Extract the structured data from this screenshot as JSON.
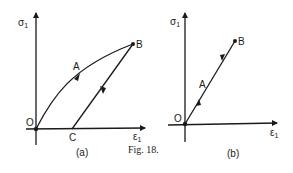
{
  "figure": {
    "caption": "Fig. 18.",
    "panels": [
      {
        "id": "a",
        "label": "(a)",
        "y_axis_label": "σ",
        "y_axis_sub": "1",
        "x_axis_label": "ε",
        "x_axis_sub": "1",
        "points": {
          "origin": "O",
          "mid": "A",
          "peak": "B",
          "unload_end": "C"
        },
        "description": "Curved loading path O→A→B, straight unloading B→C"
      },
      {
        "id": "b",
        "label": "(b)",
        "y_axis_label": "σ",
        "y_axis_sub": "1",
        "x_axis_label": "ε",
        "x_axis_sub": "1",
        "points": {
          "origin": "O",
          "mid": "A",
          "peak": "B"
        },
        "description": "Linear loading/unloading along O–A–B"
      }
    ]
  }
}
